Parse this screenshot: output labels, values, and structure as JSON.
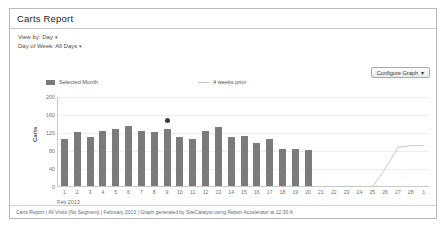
{
  "panel": {
    "title": "Carts Report"
  },
  "filters": [
    {
      "label": "View by: Day",
      "caret": "▾"
    },
    {
      "label": "Day of Week: All Days",
      "caret": "▾"
    }
  ],
  "toolbar": {
    "configure_label": "Configure Graph",
    "configure_caret": "▾"
  },
  "legend": [
    {
      "label": "Selected Month",
      "marker": "bar-swatch",
      "color": "#7a7a7a"
    },
    {
      "label": "4 weeks prior",
      "marker": "line-swatch",
      "color": "#c0c0c0"
    }
  ],
  "footer": {
    "text": "Carts Report | All Visits (No Segment) | February 2013 | Graph generated by SiteCatalyst using Report Accelerator at 12:30 A"
  },
  "colors": {
    "bar": "#7b7b7b",
    "prior_line": "#c8c8c8",
    "marker": "#3c3c3c",
    "axis": "#c8c8c8",
    "grid": "#ededed"
  },
  "chart_data": {
    "type": "bar",
    "title": "Carts Report",
    "xlabel": "",
    "ylabel": "Carts",
    "ylim": [
      0,
      200
    ],
    "yticks": [
      0,
      40,
      80,
      120,
      160,
      200
    ],
    "grid": true,
    "legend_position": "top",
    "period_label": "Feb 2013",
    "categories": [
      "1",
      "2",
      "3",
      "4",
      "5",
      "6",
      "7",
      "8",
      "9",
      "10",
      "11",
      "12",
      "13",
      "14",
      "15",
      "16",
      "17",
      "18",
      "19",
      "20",
      "21",
      "22",
      "23",
      "24",
      "25",
      "26",
      "27",
      "28",
      "1"
    ],
    "series": [
      {
        "name": "Selected Month",
        "type": "bar",
        "values": [
          104,
          121,
          110,
          122,
          127,
          134,
          122,
          120,
          127,
          110,
          104,
          122,
          132,
          110,
          111,
          96,
          104,
          83,
          82,
          81,
          null,
          null,
          null,
          null,
          null,
          null,
          null,
          null,
          null
        ]
      },
      {
        "name": "4 weeks prior",
        "type": "line",
        "values": [
          null,
          null,
          null,
          null,
          null,
          null,
          null,
          null,
          null,
          null,
          null,
          null,
          null,
          null,
          null,
          null,
          null,
          null,
          null,
          null,
          null,
          null,
          null,
          null,
          0,
          40,
          88,
          92,
          92
        ]
      }
    ],
    "annotations": [
      {
        "kind": "point-marker",
        "category": "9",
        "value": 147,
        "color": "#3c3c3c"
      }
    ]
  }
}
